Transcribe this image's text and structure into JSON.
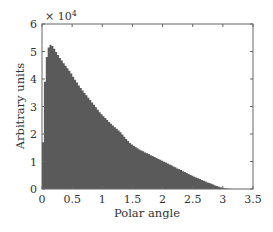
{
  "chart_data": {
    "type": "bar",
    "subtype": "histogram",
    "title": "",
    "xlabel": "Polar angle",
    "ylabel": "Arbitrary units",
    "y_multiplier_label": "× 10",
    "y_multiplier_exponent": "4",
    "xlim": [
      0,
      3.5
    ],
    "ylim": [
      0,
      6
    ],
    "x_ticks": [
      0,
      0.5,
      1,
      1.5,
      2,
      2.5,
      3,
      3.5
    ],
    "x_tick_labels": [
      "0",
      "0.5",
      "1",
      "1.5",
      "2",
      "2.5",
      "3",
      "3.5"
    ],
    "y_ticks": [
      0,
      1,
      2,
      3,
      4,
      5,
      6
    ],
    "y_tick_labels": [
      "0",
      "1",
      "2",
      "3",
      "4",
      "5",
      "6"
    ],
    "grid": false,
    "legend": null,
    "bar_color": "#5a5a5a",
    "bin_start": 0,
    "bin_width": 0.0314,
    "values_unit": "x 10^4",
    "values": [
      1.7,
      3.9,
      4.8,
      5.15,
      5.25,
      5.2,
      5.1,
      4.98,
      4.87,
      4.76,
      4.67,
      4.57,
      4.48,
      4.39,
      4.3,
      4.2,
      4.08,
      3.97,
      3.87,
      3.76,
      3.67,
      3.58,
      3.49,
      3.41,
      3.32,
      3.24,
      3.15,
      3.06,
      2.97,
      2.88,
      2.79,
      2.72,
      2.65,
      2.58,
      2.51,
      2.44,
      2.37,
      2.31,
      2.25,
      2.19,
      2.13,
      2.06,
      1.98,
      1.9,
      1.82,
      1.75,
      1.67,
      1.62,
      1.57,
      1.53,
      1.48,
      1.44,
      1.4,
      1.37,
      1.33,
      1.3,
      1.27,
      1.23,
      1.2,
      1.16,
      1.13,
      1.09,
      1.06,
      1.03,
      0.99,
      0.96,
      0.93,
      0.89,
      0.86,
      0.82,
      0.79,
      0.75,
      0.72,
      0.69,
      0.65,
      0.62,
      0.58,
      0.55,
      0.51,
      0.48,
      0.45,
      0.42,
      0.39,
      0.36,
      0.33,
      0.3,
      0.27,
      0.24,
      0.22,
      0.19,
      0.16,
      0.13,
      0.11,
      0.08,
      0.06,
      0.04,
      0.03,
      0.02,
      0.01,
      0.005
    ]
  }
}
